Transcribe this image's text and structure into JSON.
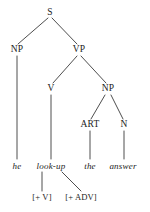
{
  "figure": {
    "type": "syntax-tree",
    "title": "",
    "line_color": "#3a3a3a",
    "text_color": "#1c1c1c",
    "background": "#ffffff"
  },
  "nodes": {
    "s": {
      "label": "S",
      "x": 50,
      "y": 13
    },
    "np_subject": {
      "label": "NP",
      "x": 17,
      "y": 50
    },
    "vp": {
      "label": "VP",
      "x": 79,
      "y": 50
    },
    "v": {
      "label": "V",
      "x": 51,
      "y": 89
    },
    "np_object": {
      "label": "NP",
      "x": 108,
      "y": 89
    },
    "art": {
      "label": "ART",
      "x": 90,
      "y": 125
    },
    "n": {
      "label": "N",
      "x": 124,
      "y": 125
    },
    "word_he": {
      "label": "he",
      "x": 17,
      "y": 166
    },
    "word_lookup": {
      "label": "look-up",
      "x": 51,
      "y": 166
    },
    "word_the": {
      "label": "the",
      "x": 90,
      "y": 166
    },
    "word_answer": {
      "label": "answer",
      "x": 123,
      "y": 166
    },
    "feat_v": {
      "label": "[+ V]",
      "x": 42,
      "y": 197
    },
    "feat_adv": {
      "label": "[+ ADV]",
      "x": 81,
      "y": 197
    }
  },
  "edges": [
    {
      "from": "s",
      "to": "np_subject",
      "x1": 48,
      "y1": 18,
      "x2": 18,
      "y2": 44
    },
    {
      "from": "s",
      "to": "vp",
      "x1": 52,
      "y1": 18,
      "x2": 77,
      "y2": 44
    },
    {
      "from": "np_subject",
      "to": "word_he",
      "x1": 17,
      "y1": 56,
      "x2": 17,
      "y2": 159
    },
    {
      "from": "vp",
      "to": "v",
      "x1": 77,
      "y1": 56,
      "x2": 53,
      "y2": 83
    },
    {
      "from": "vp",
      "to": "np_object",
      "x1": 81,
      "y1": 56,
      "x2": 106,
      "y2": 83
    },
    {
      "from": "v",
      "to": "word_lookup",
      "x1": 51,
      "y1": 95,
      "x2": 51,
      "y2": 159
    },
    {
      "from": "np_object",
      "to": "art",
      "x1": 105,
      "y1": 95,
      "x2": 91,
      "y2": 119
    },
    {
      "from": "np_object",
      "to": "n",
      "x1": 111,
      "y1": 95,
      "x2": 123,
      "y2": 119
    },
    {
      "from": "art",
      "to": "word_the",
      "x1": 90,
      "y1": 131,
      "x2": 90,
      "y2": 159
    },
    {
      "from": "n",
      "to": "word_answer",
      "x1": 124,
      "y1": 131,
      "x2": 124,
      "y2": 159
    },
    {
      "from": "word_lookup",
      "to": "feat_v",
      "x1": 42,
      "y1": 172,
      "x2": 42,
      "y2": 191
    },
    {
      "from": "word_lookup",
      "to": "feat_adv",
      "x1": 62,
      "y1": 172,
      "x2": 81,
      "y2": 191
    }
  ]
}
